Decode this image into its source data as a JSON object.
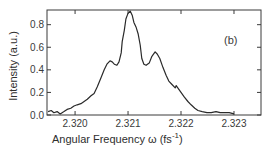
{
  "chart_data": {
    "type": "line",
    "title": "",
    "panel_label": "(b)",
    "xlabel": "Angular Frequency ω (fs⁻¹)",
    "xlabel_main": "Angular Frequency ω (fs",
    "xlabel_sup": "-1",
    "xlabel_close": ")",
    "ylabel": "Intensity (a.u.)",
    "xlim": [
      2.31947,
      2.32351
    ],
    "ylim": [
      0.0,
      0.93
    ],
    "grid": false,
    "legend": null,
    "x_ticks": [
      2.32,
      2.321,
      2.322,
      2.323
    ],
    "x_tick_labels": [
      "2.320",
      "2.321",
      "2.322",
      "2.323"
    ],
    "y_ticks": [
      0.0,
      0.2,
      0.4,
      0.6,
      0.8
    ],
    "y_tick_labels": [
      "0.0",
      "0.2",
      "0.4",
      "0.6",
      "0.8"
    ],
    "series": [
      {
        "name": "spectrum",
        "color": "#2a2a2a",
        "x": [
          2.31949,
          2.31955,
          2.3196,
          2.31966,
          2.31972,
          2.31979,
          2.31985,
          2.31992,
          2.31998,
          2.32004,
          2.32011,
          2.32017,
          2.32023,
          2.3203,
          2.32036,
          2.32042,
          2.32049,
          2.32055,
          2.3206,
          2.32066,
          2.3207,
          2.32074,
          2.32079,
          2.32083,
          2.32087,
          2.32089,
          2.32093,
          2.32096,
          2.321,
          2.32104,
          2.32108,
          2.32111,
          2.32115,
          2.32119,
          2.32123,
          2.32126,
          2.3213,
          2.32134,
          2.3214,
          2.32145,
          2.32151,
          2.32155,
          2.3216,
          2.32166,
          2.32172,
          2.32177,
          2.32183,
          2.32189,
          2.32191,
          2.32194,
          2.322,
          2.32206,
          2.32213,
          2.32219,
          2.32226,
          2.32232,
          2.3224,
          2.32249,
          2.32257,
          2.32266,
          2.32274,
          2.32283,
          2.32291,
          2.323
        ],
        "y": [
          0.03,
          0.04,
          0.02,
          0.03,
          0.01,
          0.03,
          0.05,
          0.06,
          0.08,
          0.09,
          0.1,
          0.12,
          0.14,
          0.17,
          0.19,
          0.25,
          0.33,
          0.4,
          0.45,
          0.48,
          0.47,
          0.45,
          0.44,
          0.47,
          0.55,
          0.65,
          0.75,
          0.85,
          0.9,
          0.92,
          0.88,
          0.82,
          0.78,
          0.72,
          0.62,
          0.5,
          0.45,
          0.44,
          0.46,
          0.52,
          0.56,
          0.54,
          0.5,
          0.42,
          0.35,
          0.3,
          0.27,
          0.24,
          0.26,
          0.24,
          0.2,
          0.16,
          0.12,
          0.09,
          0.06,
          0.04,
          0.03,
          0.02,
          0.02,
          0.03,
          0.02,
          0.02,
          0.02,
          0.01
        ]
      }
    ]
  }
}
